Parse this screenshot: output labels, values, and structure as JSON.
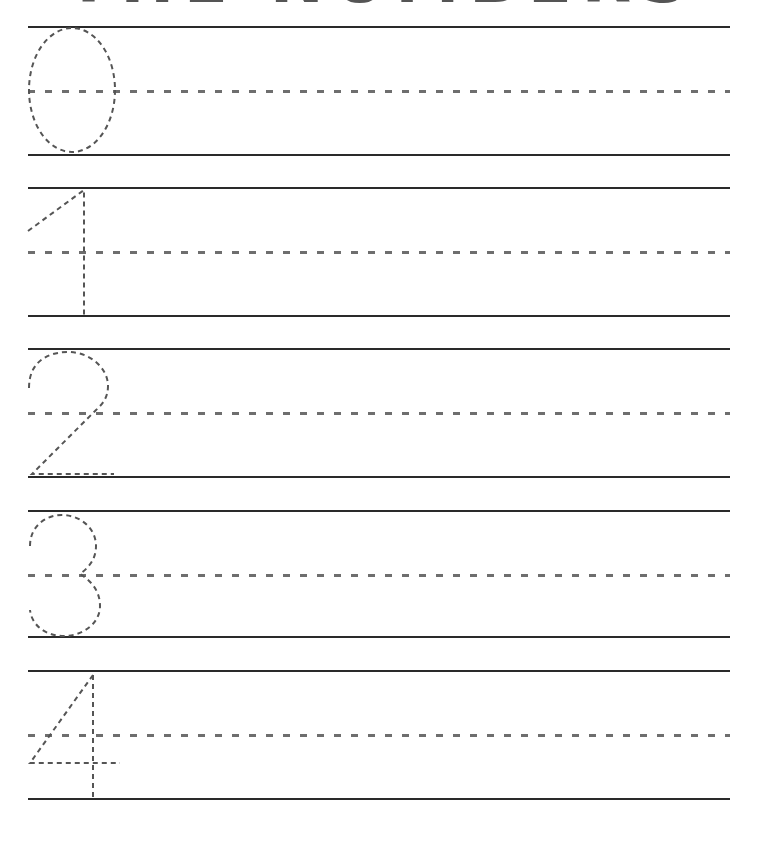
{
  "worksheet": {
    "title": "THE NUMBERS",
    "line_color": "#2a2a2a",
    "guide_color": "#6e6e6e",
    "trace_color": "#555555",
    "rows": [
      {
        "digit": "0",
        "label": "Trace the number 0"
      },
      {
        "digit": "1",
        "label": "Trace the number 1"
      },
      {
        "digit": "2",
        "label": "Trace the number 2"
      },
      {
        "digit": "3",
        "label": "Trace the number 3"
      },
      {
        "digit": "4",
        "label": "Trace the number 4"
      }
    ]
  }
}
